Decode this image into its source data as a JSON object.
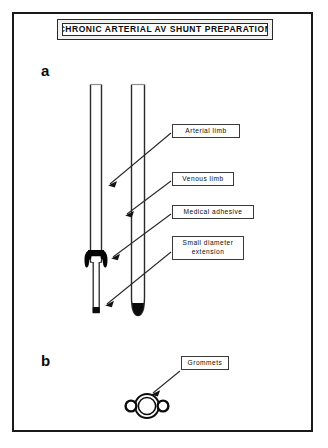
{
  "figure": {
    "title": "CHRONIC ARTERIAL AV SHUNT PREPARATION",
    "panels": [
      {
        "letter": "a",
        "description": "arterial and venous limbs of the shunt"
      },
      {
        "letter": "b",
        "description": "grommets"
      }
    ],
    "labels": {
      "arterial_limb": "Arterial  limb",
      "venous_limb": "Venous limb",
      "medical_adhesive": "Medical  adhesive",
      "small_diameter_extension": "Small  diameter extension",
      "grommets": "Grommets"
    },
    "colors": {
      "ink": "#0d0d0d",
      "border": "#1a1a1a",
      "adhesive_fill": "#000000",
      "background": "#ffffff",
      "plate_fill": "#f2f2f0"
    }
  }
}
